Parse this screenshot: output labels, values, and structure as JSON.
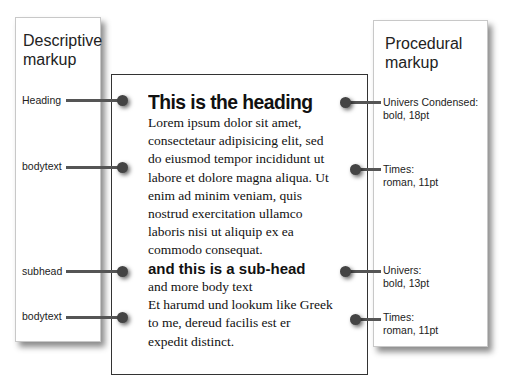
{
  "descriptive_panel": {
    "title_line1": "Descriptive",
    "title_line2": "markup",
    "labels": [
      "Heading",
      "bodytext",
      "subhead",
      "bodytext"
    ]
  },
  "procedural_panel": {
    "title_line1": "Procedural",
    "title_line2": "markup",
    "labels": [
      {
        "line1": "Univers Condensed:",
        "line2": "bold, 18pt"
      },
      {
        "line1": "Times:",
        "line2": "roman, 11pt"
      },
      {
        "line1": "Univers:",
        "line2": "bold, 13pt"
      },
      {
        "line1": "Times:",
        "line2": "roman, 11pt"
      }
    ]
  },
  "document": {
    "heading": "This is the heading",
    "body1": [
      "Lorem ipsum dolor sit amet,",
      "consectetaur adipisicing elit, sed",
      "do eiusmod tempor incididunt ut",
      "labore et dolore magna aliqua. Ut",
      "enim ad minim veniam, quis",
      "nostrud exercitation ullamco",
      "laboris nisi ut aliquip ex ea",
      "commodo consequat."
    ],
    "subhead": "and this is a sub-head",
    "body2": [
      "and more body text",
      "Et harumd und lookum like Greek",
      "to me, dereud facilis est er",
      "expedit distinct."
    ]
  }
}
